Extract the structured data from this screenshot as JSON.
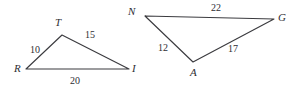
{
  "figure": {
    "stroke_color": "#3b3b3f",
    "text_color": "#2e2e33",
    "background_color": "#ffffff",
    "triangles": [
      {
        "name": "triangle-RTI",
        "vertices": [
          {
            "label": "R",
            "x": 26,
            "y": 69,
            "label_x": 14,
            "label_y": 63
          },
          {
            "label": "T",
            "x": 62,
            "y": 35,
            "label_x": 55,
            "label_y": 17
          },
          {
            "label": "I",
            "x": 129,
            "y": 69,
            "label_x": 132,
            "label_y": 63
          }
        ],
        "sides": [
          {
            "label": "10",
            "from": "R",
            "to": "T",
            "label_x": 30,
            "label_y": 45
          },
          {
            "label": "15",
            "from": "T",
            "to": "I",
            "label_x": 85,
            "label_y": 30
          },
          {
            "label": "20",
            "from": "R",
            "to": "I",
            "label_x": 70,
            "label_y": 76
          }
        ]
      },
      {
        "name": "triangle-NAG",
        "vertices": [
          {
            "label": "N",
            "x": 145,
            "y": 16,
            "label_x": 128,
            "label_y": 6
          },
          {
            "label": "G",
            "x": 274,
            "y": 19,
            "label_x": 278,
            "label_y": 12
          },
          {
            "label": "A",
            "x": 193,
            "y": 62,
            "label_x": 190,
            "label_y": 67
          }
        ],
        "sides": [
          {
            "label": "22",
            "from": "N",
            "to": "G",
            "label_x": 211,
            "label_y": 3
          },
          {
            "label": "12",
            "from": "N",
            "to": "A",
            "label_x": 158,
            "label_y": 43
          },
          {
            "label": "17",
            "from": "A",
            "to": "G",
            "label_x": 228,
            "label_y": 44
          }
        ]
      }
    ]
  }
}
